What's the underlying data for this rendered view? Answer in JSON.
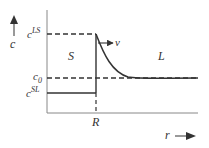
{
  "diagram": {
    "y_axis_label": "c",
    "x_axis_label": "r",
    "levels": {
      "c_LS": {
        "base": "c",
        "sup": "LS"
      },
      "c_0": {
        "base": "c",
        "sub": "0"
      },
      "c_SL": {
        "base": "c",
        "sup": "SL"
      }
    },
    "interface_label": "R",
    "velocity_label": "v",
    "region_solid": "S",
    "region_liquid": "L",
    "colors": {
      "line": "#333333",
      "axis": "#888888"
    }
  }
}
